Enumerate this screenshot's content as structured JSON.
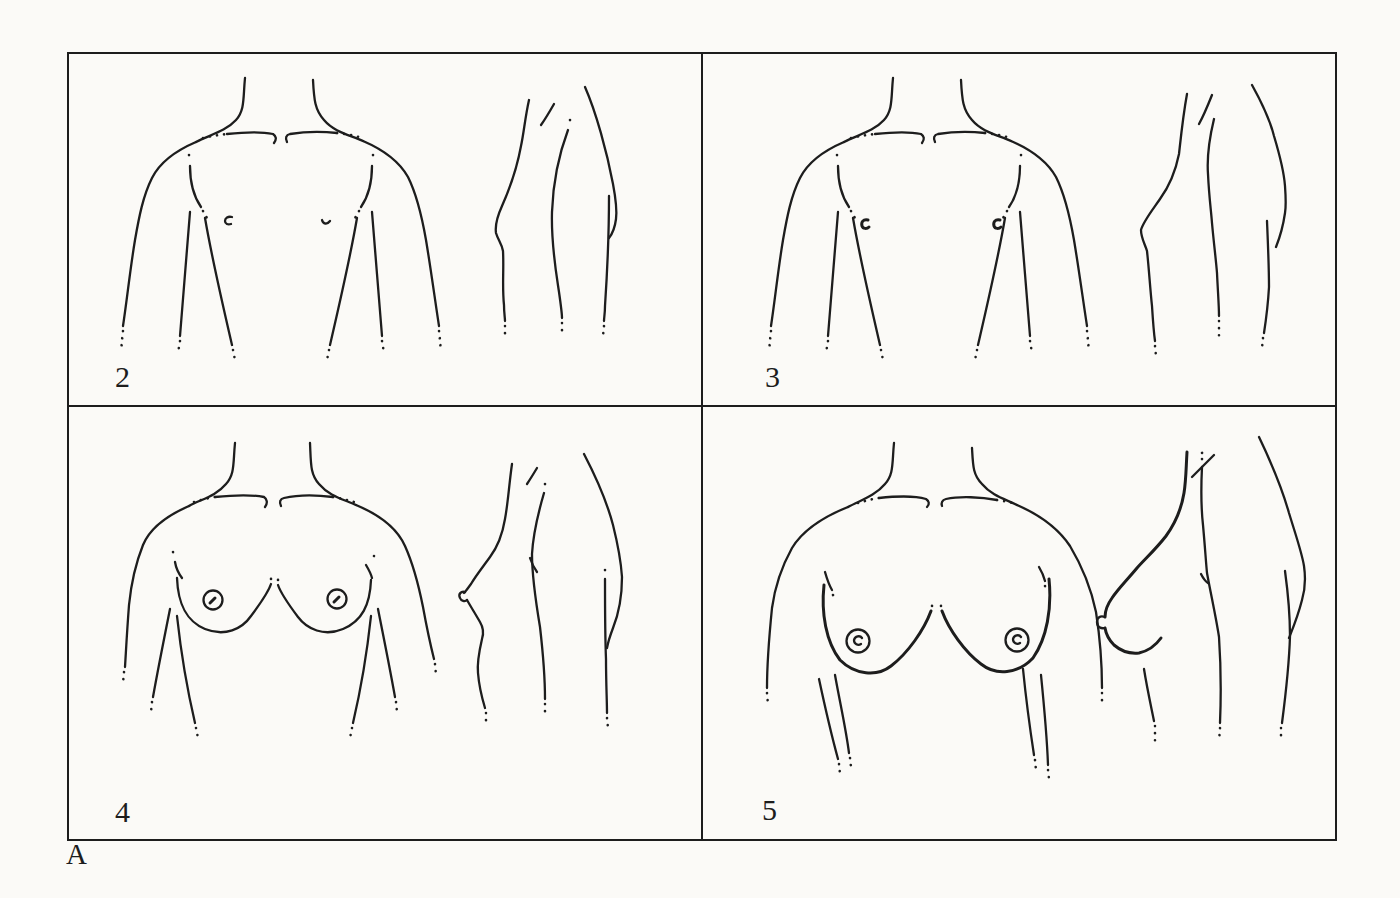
{
  "figure": {
    "part_label": "A",
    "panel_labels": [
      "2",
      "3",
      "4",
      "5"
    ],
    "colors": {
      "paper": "#fbfaf7",
      "ink": "#1d1d1d"
    }
  }
}
